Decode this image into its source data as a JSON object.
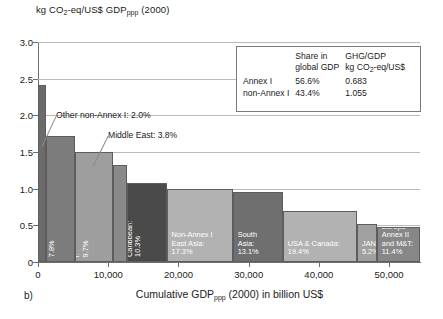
{
  "panel_label": "b)",
  "chart_data": {
    "type": "bar",
    "title": "",
    "ylabel_parts": {
      "pre": "kg CO",
      "sub1": "2",
      "mid": "-eq/US$ GDP",
      "sub2": "ppp",
      "post": " (2000)"
    },
    "ylabel_plain": "kg CO2-eq/US$ GDP ppp (2000)",
    "xlabel_parts": {
      "pre": "Cumulative GDP",
      "sub": "ppp",
      "post": " (2000) in billion US$"
    },
    "xlabel_plain": "Cumulative GDP ppp (2000) in billion US$",
    "yticks": [
      "0",
      "0.5",
      "1.0",
      "1.5",
      "2.0",
      "2.5",
      "3.0"
    ],
    "ytick_values": [
      0,
      0.5,
      1.0,
      1.5,
      2.0,
      2.5,
      3.0
    ],
    "ylim": [
      0,
      3.0
    ],
    "xticks": [
      "0",
      "10,000",
      "20,000",
      "30,000",
      "40,000",
      "50,000"
    ],
    "xtick_values": [
      0,
      10000,
      20000,
      30000,
      40000,
      50000
    ],
    "xlim": [
      0,
      54400
    ],
    "grid": "horizontal",
    "legend_position": "top-right-inset",
    "bars": [
      {
        "name": "Other non-Annex I",
        "share_pct": 2.0,
        "width_gdp": 1090,
        "x_start": 0,
        "value": 2.42,
        "color": "#6b6b6b",
        "label_text": "",
        "label_orientation": "none"
      },
      {
        "name": "Africa",
        "share_pct": 7.8,
        "width_gdp": 4250,
        "x_start": 1090,
        "value": 1.72,
        "color": "#7c7c7c",
        "label_text": "Africa: 7.8%",
        "label_orientation": "vertical"
      },
      {
        "name": "EIT Annex I",
        "share_pct": 9.7,
        "width_gdp": 5290,
        "x_start": 5340,
        "value": 1.5,
        "color": "#9e9e9e",
        "label_text": "EIT Annex I: 9.7%",
        "label_orientation": "vertical"
      },
      {
        "name": "Middle East",
        "share_pct": 3.8,
        "width_gdp": 2070,
        "x_start": 10630,
        "value": 1.32,
        "color": "#8a8a8a",
        "label_text": "",
        "label_orientation": "none"
      },
      {
        "name": "Latin America & Caribbean",
        "share_pct": 10.3,
        "width_gdp": 5610,
        "x_start": 12700,
        "value": 1.08,
        "color": "#4a4a4a",
        "label_text": "Latin America\n& Caribbean:\n10.3%",
        "label_orientation": "vertical"
      },
      {
        "name": "Non-Annex I East Asia",
        "share_pct": 17.3,
        "width_gdp": 9420,
        "x_start": 18310,
        "value": 1.0,
        "color": "#b2b2b2",
        "label_text": "Non-Annex I\nEast Asia:\n17.3%",
        "label_orientation": "horizontal"
      },
      {
        "name": "South Asia",
        "share_pct": 13.1,
        "width_gdp": 7130,
        "x_start": 27730,
        "value": 0.95,
        "color": "#6f6f6f",
        "label_text": "South\nAsia:\n13.1%",
        "label_orientation": "horizontal"
      },
      {
        "name": "USA & Canada",
        "share_pct": 19.4,
        "width_gdp": 10560,
        "x_start": 34860,
        "value": 0.7,
        "color": "#b2b2b2",
        "label_text": "USA & Canada:\n19.4%",
        "label_orientation": "horizontal"
      },
      {
        "name": "JANZ",
        "share_pct": 5.2,
        "width_gdp": 2830,
        "x_start": 45420,
        "value": 0.52,
        "color": "#a0a0a0",
        "label_text": "JANZ:\n5.2%",
        "label_orientation": "horizontal"
      },
      {
        "name": "Europe Annex II and M&T",
        "share_pct": 11.4,
        "width_gdp": 6210,
        "x_start": 48250,
        "value": 0.48,
        "color": "#878787",
        "label_text": "Europe Annex II\nand M&T: 11.4%",
        "label_orientation": "horizontal"
      }
    ],
    "annotations": [
      {
        "text": "Other non-Annex I: 2.0%",
        "target_bar": "Other non-Annex I"
      },
      {
        "text": "Middle East: 3.8%",
        "target_bar": "Middle East"
      }
    ],
    "legend_table": {
      "col_headers": [
        "",
        "Share in\nglobal GDP",
        "GHG/GDP\nkg CO2-eq/US$"
      ],
      "col_header_2_l1": "Share in",
      "col_header_2_l2": "global GDP",
      "col_header_3_l1": "GHG/GDP",
      "col_header_3_l2_pre": "kg CO",
      "col_header_3_l2_sub": "2",
      "col_header_3_l2_post": "-eq/US$",
      "rows": [
        {
          "label": "Annex I",
          "share": "56.6%",
          "intensity": "0.683"
        },
        {
          "label": "non-Annex I",
          "share": "43.4%",
          "intensity": "1.055"
        }
      ]
    }
  },
  "colors": {
    "axis": "#6e6e6e",
    "grid": "#b9b9b9",
    "text": "#1a1a1a",
    "background": "#ffffff",
    "leader": "#8a8a8a"
  }
}
